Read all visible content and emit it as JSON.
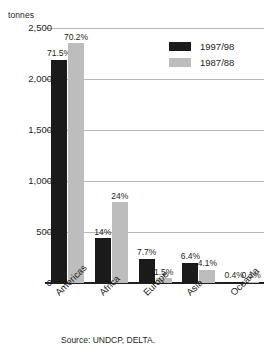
{
  "chart_data": {
    "type": "bar",
    "title": "",
    "subtitle": "",
    "xlabel": "",
    "ylabel": "tonnes",
    "ylim": [
      0,
      2500
    ],
    "yticks": [
      "0",
      "500",
      "1,000",
      "1,500",
      "2,000",
      "2,500"
    ],
    "ytick_values": [
      0,
      500,
      1000,
      1500,
      2000,
      2500
    ],
    "grid": true,
    "legend_position": "top-right",
    "categories": [
      "Americas",
      "Africa",
      "Europe",
      "Asia",
      "Oceania"
    ],
    "series": [
      {
        "name": "1997/98",
        "color": "#1a1a1a",
        "values": [
          2190,
          440,
          240,
          200,
          12
        ],
        "data_labels": [
          "71.5%",
          "14%",
          "7.7%",
          "6.4%",
          "0.4%"
        ]
      },
      {
        "name": "1987/88",
        "color": "#bdbdbd",
        "values": [
          2350,
          790,
          48,
          130,
          5
        ],
        "data_labels": [
          "70.2%",
          "24%",
          "1.5%",
          "4.1%",
          "0.1%"
        ]
      }
    ],
    "source": "Source: UNDCP, DELTA."
  },
  "legend": {
    "items": [
      {
        "label": "1997/98",
        "swatch": "dark"
      },
      {
        "label": "1987/88",
        "swatch": "light"
      }
    ]
  },
  "colors": {
    "series_1997_98": "#1a1a1a",
    "series_1987_88": "#bdbdbd",
    "gridline": "#b8b8b8",
    "axis": "#231f20",
    "background": "#ffffff"
  }
}
